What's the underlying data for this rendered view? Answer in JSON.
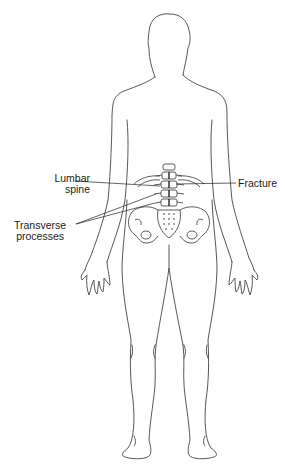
{
  "figure": {
    "labels": {
      "lumbar_spine": [
        "Lumbar",
        "spine"
      ],
      "transverse_processes": [
        "Transverse",
        "processes"
      ],
      "fracture": "Fracture"
    },
    "colors": {
      "outline": "#333333",
      "background": "#ffffff"
    }
  }
}
